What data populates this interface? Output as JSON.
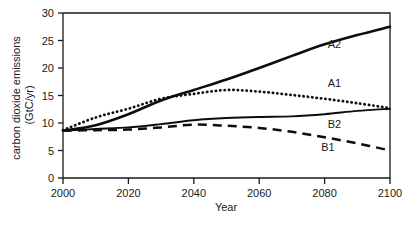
{
  "chart_data": {
    "type": "line",
    "title": "",
    "xlabel": "Year",
    "ylabel": "carbon dioxide emissions (GtC/yr)",
    "ylabel_line1": "carbon dioxide emissions",
    "ylabel_line2": "(GtC/yr)",
    "xlim": [
      2000,
      2100
    ],
    "ylim": [
      0,
      30
    ],
    "xticks": [
      2000,
      2020,
      2040,
      2060,
      2080,
      2100
    ],
    "xtick_labels": [
      "2000",
      "2020",
      "2040",
      "2060",
      "2080",
      "2100"
    ],
    "yticks": [
      0,
      5,
      10,
      15,
      20,
      25,
      30
    ],
    "ytick_labels": [
      "0",
      "5",
      "10",
      "15",
      "20",
      "25",
      "30"
    ],
    "grid": false,
    "legend_position": "inline-right",
    "x": [
      2000,
      2010,
      2020,
      2030,
      2040,
      2050,
      2060,
      2070,
      2080,
      2090,
      2100
    ],
    "series": [
      {
        "name": "A2",
        "label": "A2",
        "style": "solid",
        "label_x": 2083,
        "label_y": 24.3,
        "values": [
          8.6,
          9.6,
          11.6,
          14.1,
          16.0,
          17.9,
          20.0,
          22.2,
          24.3,
          26.0,
          27.5
        ]
      },
      {
        "name": "A1",
        "label": "A1",
        "style": "dotted",
        "label_x": 2083,
        "label_y": 17.2,
        "values": [
          8.7,
          11.0,
          12.6,
          14.4,
          15.3,
          16.0,
          15.7,
          15.1,
          14.4,
          13.6,
          12.7
        ]
      },
      {
        "name": "B2",
        "label": "B2",
        "style": "solid-thin",
        "label_x": 2083,
        "label_y": 9.8,
        "values": [
          8.6,
          8.9,
          9.2,
          9.8,
          10.5,
          10.9,
          11.1,
          11.2,
          11.6,
          12.2,
          12.6
        ]
      },
      {
        "name": "B1",
        "label": "B1",
        "style": "dashed",
        "label_x": 2081,
        "label_y": 5.6,
        "values": [
          8.6,
          8.7,
          8.8,
          9.2,
          9.7,
          9.5,
          9.1,
          8.4,
          7.4,
          6.3,
          5.0
        ]
      }
    ]
  }
}
